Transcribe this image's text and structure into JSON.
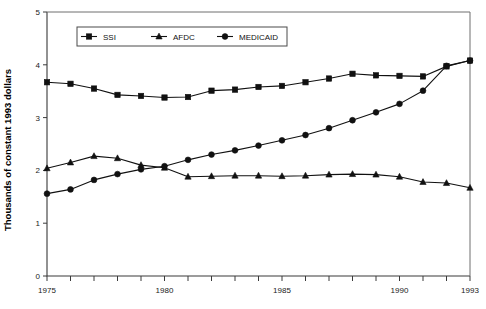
{
  "chart_data": {
    "type": "line",
    "title": "",
    "subtitle": "",
    "xlabel": "",
    "ylabel": "Thousands of constant 1993 dollars",
    "x": [
      1975,
      1976,
      1977,
      1978,
      1979,
      1980,
      1981,
      1982,
      1983,
      1984,
      1985,
      1986,
      1987,
      1988,
      1989,
      1990,
      1991,
      1992,
      1993
    ],
    "xlim": [
      1975,
      1993
    ],
    "ylim": [
      0,
      5
    ],
    "xtick_values": [
      1975,
      1976,
      1977,
      1978,
      1979,
      1980,
      1981,
      1982,
      1983,
      1984,
      1985,
      1986,
      1987,
      1988,
      1989,
      1990,
      1991,
      1992,
      1993
    ],
    "xtick_labels": [
      "1975",
      "",
      "",
      "",
      "",
      "1980",
      "",
      "",
      "",
      "",
      "1985",
      "",
      "",
      "",
      "",
      "1990",
      "",
      "",
      "1993"
    ],
    "ytick_values": [
      0,
      1,
      2,
      3,
      4,
      5
    ],
    "ytick_labels": [
      "0",
      "1",
      "2",
      "3",
      "4",
      "5"
    ],
    "grid": false,
    "legend_position": "top-center",
    "series": [
      {
        "name": "SSI",
        "marker": "square",
        "color": "#111111",
        "values": [
          3.67,
          3.64,
          3.55,
          3.43,
          3.41,
          3.38,
          3.39,
          3.51,
          3.53,
          3.58,
          3.6,
          3.67,
          3.74,
          3.83,
          3.8,
          3.79,
          3.78,
          3.97,
          4.08
        ]
      },
      {
        "name": "AFDC",
        "marker": "triangle",
        "color": "#111111",
        "values": [
          2.04,
          2.15,
          2.27,
          2.23,
          2.1,
          2.05,
          1.88,
          1.89,
          1.9,
          1.9,
          1.89,
          1.9,
          1.92,
          1.93,
          1.92,
          1.88,
          1.78,
          1.76,
          1.67
        ]
      },
      {
        "name": "MEDICAID",
        "marker": "circle",
        "color": "#111111",
        "values": [
          1.56,
          1.64,
          1.82,
          1.93,
          2.02,
          2.08,
          2.2,
          2.3,
          2.38,
          2.47,
          2.57,
          2.67,
          2.8,
          2.95,
          3.1,
          3.26,
          3.51,
          3.98,
          4.08
        ]
      }
    ]
  }
}
